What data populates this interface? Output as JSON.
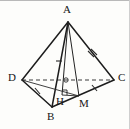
{
  "figure": {
    "kind": "geometry-diagram",
    "canvas": {
      "width": 130,
      "height": 129
    },
    "background_color": "#fdfdfb",
    "stroke_color": "#1d1d1d",
    "hidden_stroke_color": "#3a3a3a",
    "border_color": "#b9b9b9"
  },
  "points": {
    "A": {
      "label": "A",
      "x": 68,
      "y": 22,
      "label_x": 63,
      "label_y": 4
    },
    "B": {
      "label": "B",
      "x": 52,
      "y": 107,
      "label_x": 47,
      "label_y": 111
    },
    "C": {
      "label": "C",
      "x": 114,
      "y": 80,
      "label_x": 118,
      "label_y": 72
    },
    "D": {
      "label": "D",
      "x": 22,
      "y": 80,
      "label_x": 8,
      "label_y": 72
    },
    "H": {
      "label": "H",
      "x": 62,
      "y": 95,
      "label_x": 56,
      "label_y": 96
    },
    "M": {
      "label": "M",
      "x": 79,
      "y": 96,
      "label_x": 79,
      "label_y": 98
    },
    "O": {
      "label": "",
      "x": 66,
      "y": 80,
      "label_x": 0,
      "label_y": 0
    }
  },
  "edges": [
    {
      "name": "edge-AD",
      "from": "A",
      "to": "D",
      "style": "solid",
      "width": 1.5
    },
    {
      "name": "edge-AC",
      "from": "A",
      "to": "C",
      "style": "solid",
      "width": 1.5
    },
    {
      "name": "edge-AB",
      "from": "A",
      "to": "B",
      "style": "solid",
      "width": 1.5
    },
    {
      "name": "edge-DB",
      "from": "D",
      "to": "B",
      "style": "solid",
      "width": 1.5
    },
    {
      "name": "edge-BC",
      "from": "B",
      "to": "C",
      "style": "solid",
      "width": 1.5
    },
    {
      "name": "edge-DC-hidden",
      "from": "D",
      "to": "C",
      "style": "dashed",
      "width": 1.2
    },
    {
      "name": "segment-AH",
      "from": "A",
      "to": "H",
      "style": "solid",
      "width": 1.0
    },
    {
      "name": "segment-AM",
      "from": "A",
      "to": "M",
      "style": "solid",
      "width": 1.0
    },
    {
      "name": "segment-HM",
      "from": "H",
      "to": "M",
      "style": "solid",
      "width": 1.0
    },
    {
      "name": "segment-DM",
      "from": "D",
      "to": "M",
      "style": "solid",
      "width": 1.0
    }
  ],
  "marks": {
    "right_angle": {
      "name": "right-angle-at-H",
      "at": "H",
      "size": 5
    },
    "tick_marks": [
      {
        "name": "tick-on-AB",
        "edge": "edge-AB",
        "t": 0.48,
        "count": 1
      },
      {
        "name": "tick-on-AC",
        "edge": "edge-AC",
        "t": 0.5,
        "count": 2
      },
      {
        "name": "tick-on-BC",
        "edge": "edge-BC",
        "t": 0.55,
        "count": 1
      },
      {
        "name": "tick-on-DB",
        "edge": "edge-DB",
        "t": 0.55,
        "count": 1
      }
    ],
    "intersection_dot": {
      "name": "intersection-marker",
      "at": "O",
      "radius": 2.2
    }
  },
  "labels": [
    "A",
    "B",
    "C",
    "D",
    "H",
    "M"
  ]
}
